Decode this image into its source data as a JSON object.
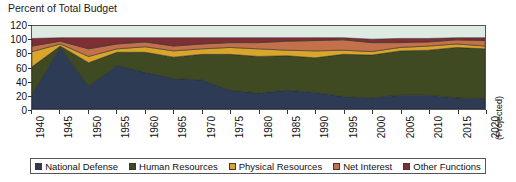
{
  "chart": {
    "title": "Percent of Total Budget",
    "projected_note": "(Projected)"
  },
  "legend": {
    "items": [
      {
        "label": "National Defense",
        "color": "#2e3b54"
      },
      {
        "label": "Human Resources",
        "color": "#3f4a22"
      },
      {
        "label": "Physical Resources",
        "color": "#d9a52b"
      },
      {
        "label": "Net Interest",
        "color": "#c2714a"
      },
      {
        "label": "Other Functions",
        "color": "#7d2f33"
      }
    ]
  },
  "chart_data": {
    "type": "area",
    "title": "Percent of Total Budget",
    "xlabel": "",
    "ylabel": "Percent of Total Budget",
    "ylim": [
      0,
      120
    ],
    "yticks": [
      0,
      20,
      40,
      60,
      80,
      100,
      120
    ],
    "xlim": [
      1940,
      2020
    ],
    "xticks": [
      1940,
      1945,
      1950,
      1955,
      1960,
      1965,
      1970,
      1975,
      1980,
      1985,
      1990,
      1995,
      2000,
      2005,
      2010,
      2015,
      2020
    ],
    "grid": false,
    "legend_position": "bottom",
    "stacked": true,
    "annotations": [
      "(Projected)"
    ],
    "x": [
      1940,
      1945,
      1950,
      1955,
      1960,
      1965,
      1970,
      1975,
      1980,
      1985,
      1990,
      1995,
      2000,
      2005,
      2010,
      2015,
      2020
    ],
    "series": [
      {
        "name": "National Defense",
        "color": "#2e3b54",
        "values": [
          21,
          89,
          33,
          63,
          53,
          44,
          42,
          27,
          23,
          27,
          24,
          18,
          16,
          20,
          20,
          16,
          15
        ]
      },
      {
        "name": "Human Resources",
        "color": "#3f4a22",
        "values": [
          40,
          2,
          34,
          19,
          29,
          31,
          37,
          52,
          53,
          50,
          50,
          61,
          62,
          64,
          65,
          73,
          72
        ]
      },
      {
        "name": "Physical Resources",
        "color": "#d9a52b",
        "values": [
          22,
          3,
          9,
          5,
          8,
          9,
          8,
          10,
          11,
          8,
          10,
          6,
          5,
          5,
          6,
          5,
          4
        ]
      },
      {
        "name": "Net Interest",
        "color": "#c2714a",
        "values": [
          8,
          4,
          11,
          7,
          7,
          7,
          7,
          7,
          9,
          13,
          15,
          15,
          13,
          7,
          6,
          6,
          8
        ]
      },
      {
        "name": "Other Functions",
        "color": "#7d2f33",
        "values": [
          11,
          5,
          16,
          9,
          6,
          12,
          9,
          7,
          7,
          5,
          4,
          3,
          5,
          6,
          5,
          3,
          4
        ]
      }
    ]
  }
}
